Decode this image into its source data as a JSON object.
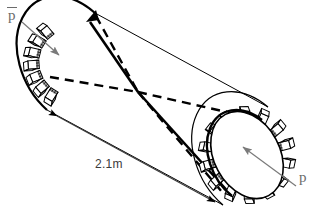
{
  "figure": {
    "type": "engineering-diagram",
    "projection": "oblique",
    "background_color": "#ffffff",
    "line_color": "#000000",
    "annotation_color": "#6b6b6b"
  },
  "labels": {
    "external_pressure": "p",
    "external_pressure_has_overbar": true,
    "internal_pressure": "p",
    "internal_pressure_has_overbar": false,
    "length_dimension": "2.1m"
  },
  "geometry": {
    "near_flange": {
      "center_x": 247,
      "center_y": 155,
      "rx": 33,
      "ry": 46,
      "rotation_deg": -28,
      "bolt_count": 14
    },
    "far_flange": {
      "center_x": 72,
      "center_y": 62,
      "rx": 33,
      "ry": 46,
      "rotation_deg": -28,
      "bolt_count": 7
    },
    "convergence_point": {
      "x": 138,
      "y": 92
    },
    "axis_angle_deg": 28
  },
  "annotations": {
    "dimension_arrow_style": "double-headed",
    "pressure_arrow_style": "single-headed",
    "hidden_edges_style": "dashed"
  }
}
